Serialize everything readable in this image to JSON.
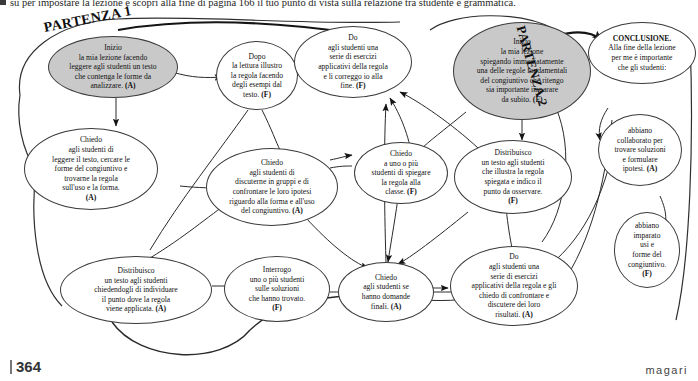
{
  "page": {
    "intro_text": "su per impostare la lezione e scopri alla fine di pagina 166 il tuo punto di vista sulla relazione tra studente e grammatica.",
    "folio": "364",
    "brand": "magari"
  },
  "labels": {
    "partenza1": "PARTENZA 1",
    "partenza2": "PARTENZA 2"
  },
  "nodes": {
    "inizio1": "Inizio<br>la mia lezione facendo<br>leggere agli studenti un testo<br>che contenga le forme da<br>analizzare. <b>(A)</b>",
    "dopo_lettura": "Dopo<br>la lettura illustro<br>la regola facendo<br>degli esempi dal<br>testo. <b>(F)</b>",
    "do_esercizi_correggo": "Do<br>agli studenti una<br>serie di esercizi<br>applicativi della regola<br>e li correggo io alla<br>fine. <b>(F)</b>",
    "inizio2": "Inizio<br>la mia lezione<br>spiegando immediatamente<br>una delle regole fondamentali<br>del congiuntivo che ritengo<br>sia importante imparare<br>da subito. <b>(F)</b>",
    "conclusione": "<b>CONCLUSIONE.</b><br>Alla fine della lezione<br>per me è importante<br>che gli studenti:",
    "chiedo_leggere": "Chiedo<br>agli studenti di<br>leggere il testo, cercare le<br>forme del congiuntivo e<br>trovarne la regola<br>sull'uso e la forma.<br><b>(A)</b>",
    "chiedo_discuterne": "Chiedo<br>agli studenti di<br>discuterne in gruppi e di<br>confrontare le loro ipotesi<br>riguardo alla forma e all'uso<br>del congiuntivo. <b>(A)</b>",
    "chiedo_spiegare": "Chiedo<br>a uno o più<br>studenti di spiegare<br>la regola alla<br>classe. <b>(F)</b>",
    "distribuisco_illustra": "Distribuisco<br>un testo agli studenti<br>che illustra la regola<br>spiegata e indico il<br>punto da osservare.<br><b>(F)</b>",
    "abbiano_collaborato": "abbiano<br>collaborato per<br>trovare soluzioni<br>e formulare<br>ipotesi. <b>(A)</b>",
    "abbiano_imparato": "abbiano<br>imparato<br>usi e<br>forme del<br>congiuntivo.<br><b>(F)</b>",
    "distribuisco_individuare": "Distribuisco<br>un testo agli studenti<br>chiedendogli di individuare<br>il punto dove la regola<br>viene applicata. <b>(A)</b>",
    "interrogo": "Interrogo<br>uno o più studenti<br>sulle soluzioni<br>che hanno trovato.<br><b>(F)</b>",
    "chiedo_domande": "Chiedo<br>agli studenti se<br>hanno domande<br>finali. <b>(A)</b>",
    "do_esercizi_confrontare": "Do<br>agli studenti una<br>serie di esercizi<br>applicativi della regola e gli<br>chiedo di confrontare e<br>discutere dei loro<br>risultati. <b>(A)</b>"
  },
  "colors": {
    "shaded_fill": "#c9c9c9",
    "stroke": "#3a3a3a",
    "text": "#111111"
  }
}
